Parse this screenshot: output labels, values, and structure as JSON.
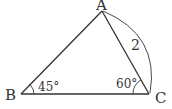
{
  "diagram": {
    "type": "triangle",
    "vertices": {
      "A": {
        "label": "A",
        "x": 102,
        "y": 11
      },
      "B": {
        "label": "B",
        "x": 21,
        "y": 94
      },
      "C": {
        "label": "C",
        "x": 149,
        "y": 94
      }
    },
    "angles": {
      "B": {
        "label": "45°"
      },
      "C": {
        "label": "60°"
      }
    },
    "sides": {
      "AC": {
        "label": "2"
      }
    },
    "colors": {
      "stroke": "#333333",
      "background": "#ffffff"
    }
  }
}
